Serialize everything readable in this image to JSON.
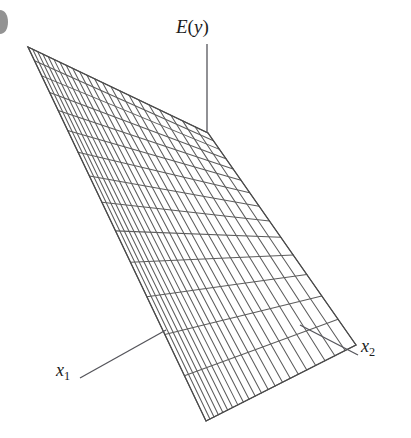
{
  "figure": {
    "type": "3d-wireframe-surface",
    "background_color": "#ffffff",
    "line_color": "#5d5d5d",
    "edge_color": "#4a4a4a",
    "label_color": "#1c1c1c",
    "width": 411,
    "height": 438
  },
  "labels": {
    "surface": {
      "text": "E(y)",
      "name_part": "E",
      "open_paren": "(",
      "variable": "y",
      "close_paren": ")"
    },
    "axis_x1": {
      "base": "x",
      "subscript": "1"
    },
    "axis_x2": {
      "base": "x",
      "subscript": "2"
    }
  },
  "leaders": [
    {
      "name": "ey-leader",
      "from": [
        207,
        44
      ],
      "to": [
        207,
        133
      ]
    },
    {
      "name": "x1-leader",
      "from": [
        80,
        378
      ],
      "to": [
        166,
        330
      ]
    },
    {
      "name": "x2-leader",
      "from": [
        358,
        355
      ],
      "to": [
        300,
        325
      ]
    }
  ],
  "chart_data": {
    "type": "surface",
    "title": "E(y)",
    "xlabel": "x1",
    "ylabel": "x2",
    "zlabel": "E(y)",
    "grid": true,
    "legend": null,
    "surface_kind": "plane",
    "corners": {
      "top_left_apex": [
        28,
        47
      ],
      "top_right": [
        208,
        133
      ],
      "right": [
        356,
        345
      ],
      "bottom": [
        206,
        421
      ]
    },
    "mesh_divisions": {
      "u_lines": 14,
      "v_lines": 22
    },
    "annotations": [
      {
        "text": "E(y)",
        "anchor": [
          207,
          30
        ]
      },
      {
        "text": "x1",
        "anchor": [
          66,
          370
        ]
      },
      {
        "text": "x2",
        "anchor": [
          370,
          346
        ]
      }
    ]
  }
}
